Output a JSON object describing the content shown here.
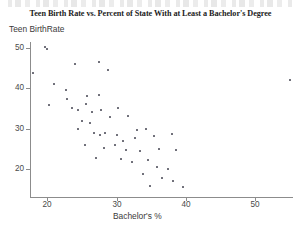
{
  "page": {
    "ghost_text_top": "cut-off text line above title"
  },
  "chart_data": {
    "type": "scatter",
    "title": "Teen Birth Rate vs. Percent of State With at Least a Bachelor's Degree",
    "xlabel": "Bachelor's %",
    "ylabel": "Teen BirthRate",
    "xlim": [
      17.5,
      55.5
    ],
    "ylim": [
      13,
      51.5
    ],
    "xticks": [
      20,
      30,
      40,
      50
    ],
    "yticks": [
      20,
      30,
      40,
      50
    ],
    "xtick_labels": [
      "20",
      "30",
      "40",
      "50"
    ],
    "ytick_labels": [
      "20",
      "30",
      "40",
      "50"
    ],
    "grid": false,
    "legend": null,
    "marker": "square",
    "marker_color": "#6e6e78",
    "marker_size": 2,
    "axis_color": "#8c8c8c",
    "points": [
      {
        "x": 19.6,
        "y": 50.2
      },
      {
        "x": 20.0,
        "y": 49.8
      },
      {
        "x": 18.0,
        "y": 43.8
      },
      {
        "x": 21.0,
        "y": 41.0
      },
      {
        "x": 24.0,
        "y": 46.0
      },
      {
        "x": 27.5,
        "y": 46.5
      },
      {
        "x": 28.8,
        "y": 44.5
      },
      {
        "x": 22.7,
        "y": 39.7
      },
      {
        "x": 22.8,
        "y": 37.4
      },
      {
        "x": 25.8,
        "y": 38.2
      },
      {
        "x": 27.4,
        "y": 38.4
      },
      {
        "x": 20.2,
        "y": 35.8
      },
      {
        "x": 23.6,
        "y": 35.0
      },
      {
        "x": 24.5,
        "y": 34.6
      },
      {
        "x": 25.6,
        "y": 36.2
      },
      {
        "x": 26.5,
        "y": 34.0
      },
      {
        "x": 27.8,
        "y": 34.5
      },
      {
        "x": 30.2,
        "y": 35.0
      },
      {
        "x": 25.0,
        "y": 32.0
      },
      {
        "x": 26.2,
        "y": 31.5
      },
      {
        "x": 29.0,
        "y": 32.8
      },
      {
        "x": 31.6,
        "y": 33.0
      },
      {
        "x": 33.0,
        "y": 29.6
      },
      {
        "x": 34.2,
        "y": 29.8
      },
      {
        "x": 24.4,
        "y": 30.0
      },
      {
        "x": 26.8,
        "y": 28.8
      },
      {
        "x": 27.6,
        "y": 28.4
      },
      {
        "x": 28.4,
        "y": 29.0
      },
      {
        "x": 30.0,
        "y": 28.5
      },
      {
        "x": 31.0,
        "y": 27.0
      },
      {
        "x": 32.6,
        "y": 27.6
      },
      {
        "x": 35.4,
        "y": 28.2
      },
      {
        "x": 38.0,
        "y": 28.6
      },
      {
        "x": 25.4,
        "y": 26.0
      },
      {
        "x": 28.2,
        "y": 25.2
      },
      {
        "x": 29.8,
        "y": 25.8
      },
      {
        "x": 31.4,
        "y": 24.6
      },
      {
        "x": 33.4,
        "y": 24.4
      },
      {
        "x": 36.2,
        "y": 25.0
      },
      {
        "x": 38.6,
        "y": 24.6
      },
      {
        "x": 27.0,
        "y": 22.8
      },
      {
        "x": 30.6,
        "y": 22.4
      },
      {
        "x": 32.2,
        "y": 21.8
      },
      {
        "x": 34.6,
        "y": 22.2
      },
      {
        "x": 35.8,
        "y": 20.4
      },
      {
        "x": 37.4,
        "y": 20.0
      },
      {
        "x": 33.8,
        "y": 18.6
      },
      {
        "x": 36.6,
        "y": 17.8
      },
      {
        "x": 38.2,
        "y": 17.0
      },
      {
        "x": 34.8,
        "y": 15.8
      },
      {
        "x": 39.6,
        "y": 15.4
      },
      {
        "x": 55.0,
        "y": 42.0
      }
    ]
  }
}
